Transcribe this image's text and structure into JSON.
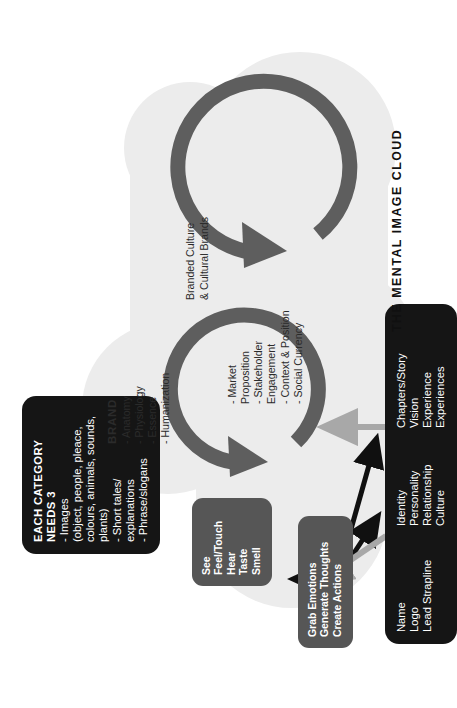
{
  "diagram": {
    "title": "THE MENTAL IMAGE CLOUD",
    "colors": {
      "cloud": "#ececec",
      "circle_arrow": "#5e5e5e",
      "black_box": "#151515",
      "gray_box": "#565656",
      "black_arrow": "#101010",
      "gray_arrow": "#a8a8a8",
      "text_light": "#ffffff",
      "text_dark": "#2b2b2b"
    }
  },
  "category_box": {
    "title_line1": "EACH CATEGORY",
    "title_line2": "NEEDS 3",
    "items": [
      "- Images",
      "(object, people, pleace,",
      "colours, animals, sounds,",
      "plants)",
      "- Short tales/",
      "explanations",
      "- Phrase/slogans"
    ]
  },
  "senses_box": {
    "items": [
      "See",
      "Feel/Touch",
      "Hear",
      "Taste",
      "Smell"
    ]
  },
  "effects_box": {
    "items": [
      "Grab Emotions",
      "Generate Thoughts",
      "Create Actions"
    ]
  },
  "brand_circle": {
    "title": "BRAND",
    "items": [
      "- Anatomy",
      "- Physiology",
      "- Essence",
      "- Humanization"
    ]
  },
  "market_circle": {
    "items": [
      "- Market",
      "Proposition",
      "- Stakeholder",
      "Engagement",
      "- Context & Position",
      "- Social Currency"
    ]
  },
  "culture_circle": {
    "line1": "Branded Culture",
    "line2": "& Cultural Brands"
  },
  "assets_box": {
    "group1": [
      "Name",
      "Logo",
      "Lead Strapline"
    ],
    "group2": [
      "Identity",
      "Personality",
      "Relationship",
      "Culture"
    ],
    "group3": [
      "Chapters/Story",
      "Vision",
      "Experience",
      "Experiences"
    ]
  }
}
